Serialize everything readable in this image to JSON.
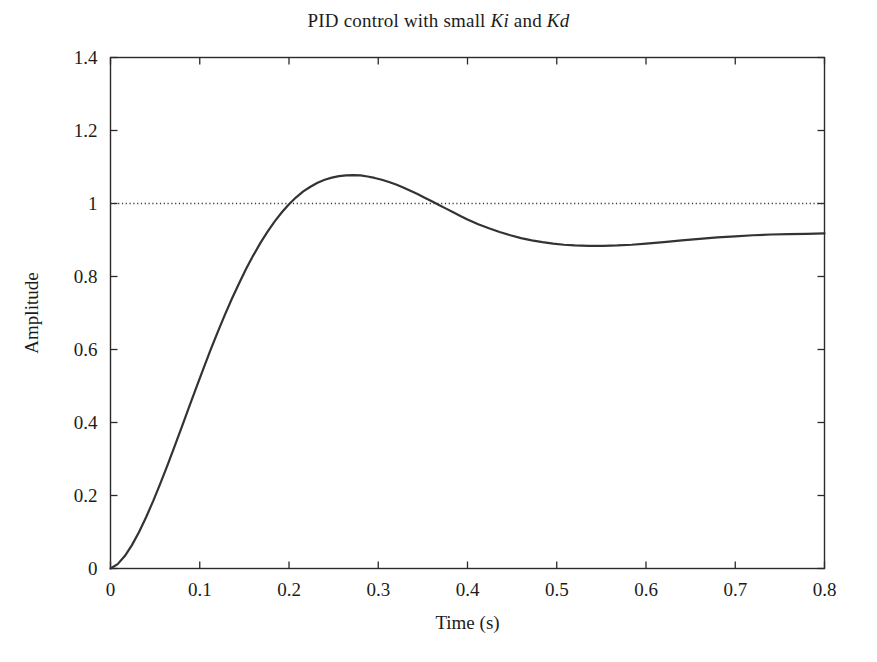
{
  "figure": {
    "background_color": "#ffffff",
    "title_prefix": "PID control with small ",
    "title_var1": "Ki",
    "title_conjunction": " and ",
    "title_var2": "Kd",
    "title_full": "PID control with small Ki and Kd"
  },
  "chart_data": {
    "type": "line",
    "title": "PID control with small Ki and Kd",
    "xlabel": "Time (s)",
    "ylabel": "Amplitude",
    "xlim": [
      0,
      0.8
    ],
    "ylim": [
      0,
      1.4
    ],
    "grid": false,
    "legend": "none",
    "line_color": "#333333",
    "line_width": 2.2,
    "xticks": [
      0,
      0.1,
      0.2,
      0.3,
      0.4,
      0.5,
      0.6,
      0.7,
      0.8
    ],
    "xtick_labels": [
      "0",
      "0.1",
      "0.2",
      "0.3",
      "0.4",
      "0.5",
      "0.6",
      "0.7",
      "0.8"
    ],
    "yticks": [
      0,
      0.2,
      0.4,
      0.6,
      0.8,
      1,
      1.2,
      1.4
    ],
    "ytick_labels": [
      "0",
      "0.2",
      "0.4",
      "0.6",
      "0.8",
      "1",
      "1.2",
      "1.4"
    ],
    "annotations": [
      {
        "name": "setpoint-reference-line",
        "type": "horizontal-dotted-line",
        "y": 1.0,
        "color": "#3a3a3a",
        "style": "dotted"
      }
    ],
    "series": [
      {
        "name": "step-response",
        "color": "#333333",
        "x": [
          0.0,
          0.008,
          0.016,
          0.024,
          0.032,
          0.04,
          0.048,
          0.056,
          0.064,
          0.072,
          0.08,
          0.088,
          0.096,
          0.104,
          0.112,
          0.12,
          0.128,
          0.136,
          0.144,
          0.152,
          0.16,
          0.168,
          0.176,
          0.184,
          0.192,
          0.2,
          0.208,
          0.216,
          0.224,
          0.232,
          0.24,
          0.248,
          0.256,
          0.264,
          0.272,
          0.28,
          0.288,
          0.296,
          0.304,
          0.312,
          0.32,
          0.328,
          0.336,
          0.344,
          0.352,
          0.36,
          0.368,
          0.376,
          0.384,
          0.392,
          0.4,
          0.412,
          0.424,
          0.436,
          0.448,
          0.46,
          0.472,
          0.484,
          0.496,
          0.508,
          0.52,
          0.536,
          0.552,
          0.568,
          0.584,
          0.6,
          0.62,
          0.64,
          0.66,
          0.68,
          0.7,
          0.72,
          0.74,
          0.76,
          0.78,
          0.8
        ],
        "y": [
          0.0,
          0.012,
          0.034,
          0.064,
          0.1,
          0.141,
          0.186,
          0.234,
          0.284,
          0.336,
          0.389,
          0.442,
          0.495,
          0.547,
          0.598,
          0.647,
          0.694,
          0.739,
          0.781,
          0.821,
          0.858,
          0.892,
          0.923,
          0.951,
          0.976,
          0.998,
          1.017,
          1.033,
          1.046,
          1.057,
          1.065,
          1.071,
          1.075,
          1.077,
          1.078,
          1.077,
          1.074,
          1.07,
          1.065,
          1.059,
          1.052,
          1.044,
          1.035,
          1.026,
          1.016,
          1.006,
          0.996,
          0.986,
          0.976,
          0.966,
          0.956,
          0.943,
          0.932,
          0.922,
          0.913,
          0.905,
          0.899,
          0.894,
          0.89,
          0.887,
          0.885,
          0.884,
          0.884,
          0.885,
          0.887,
          0.89,
          0.894,
          0.899,
          0.903,
          0.907,
          0.91,
          0.913,
          0.915,
          0.916,
          0.917,
          0.918
        ],
        "peak_value": 1.078,
        "peak_time": 0.272,
        "trough_value": 0.884,
        "trough_time": 0.54,
        "final_value": 0.918
      }
    ]
  }
}
